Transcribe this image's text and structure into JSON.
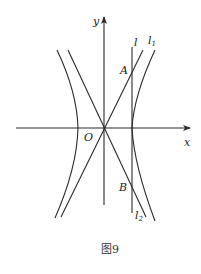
{
  "figure": {
    "caption": "图9",
    "axes": {
      "x_label": "x",
      "y_label": "y",
      "origin_label": "O"
    },
    "lines": {
      "l": "l",
      "l1": {
        "base": "l",
        "sub": "1"
      },
      "l2": {
        "base": "l",
        "sub": "2"
      }
    },
    "points": {
      "A": "A",
      "B": "B"
    },
    "colors": {
      "stroke": "#2a2a2a",
      "background": "#ffffff"
    }
  }
}
